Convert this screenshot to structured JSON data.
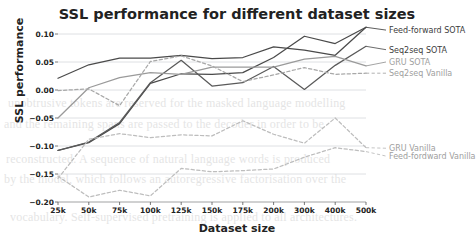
{
  "chart_data": {
    "type": "line",
    "title": "SSL performance for different dataset sizes",
    "xlabel": "Dataset size",
    "ylabel": "SSL performance",
    "categories": [
      "25k",
      "50k",
      "75k",
      "100k",
      "125k",
      "150k",
      "175k",
      "200k",
      "300k",
      "400k",
      "500k"
    ],
    "ylim": [
      -0.2,
      0.1
    ],
    "yticks": [
      "0.10",
      "0.05",
      "0.00",
      "−0.05",
      "−0.10",
      "−0.15",
      "−0.20"
    ],
    "ytick_values": [
      0.1,
      0.05,
      0.0,
      -0.05,
      -0.1,
      -0.15,
      -0.2
    ],
    "grid": "horizontal",
    "legend_position": "line-end-labels",
    "series": [
      {
        "name": "Feed-forward SOTA",
        "style": "solid",
        "color": "#4a4a4a",
        "label_y": 0.107,
        "values": [
          -0.108,
          -0.094,
          -0.06,
          0.012,
          0.029,
          0.028,
          0.031,
          0.058,
          0.096,
          0.083,
          0.112
        ]
      },
      {
        "name": "Seq2seq SOTA",
        "style": "solid",
        "color": "#5a5a5a",
        "label_y": 0.072,
        "values": [
          -0.108,
          -0.093,
          -0.058,
          0.013,
          0.053,
          0.007,
          0.013,
          0.042,
          0.001,
          0.044,
          0.078
        ]
      },
      {
        "name": "GRU SOTA",
        "style": "solid",
        "color": "#9a9a9a",
        "label_y": 0.05,
        "values": [
          -0.05,
          0.004,
          0.022,
          0.031,
          0.028,
          0.041,
          0.041,
          0.041,
          0.055,
          0.06,
          0.043
        ]
      },
      {
        "name": "Seq2seq Vanilla",
        "style": "dashed",
        "color": "#a8a8a8",
        "label_y": 0.03,
        "values": [
          -0.001,
          0.002,
          -0.028,
          0.051,
          0.061,
          0.043,
          0.015,
          0.027,
          0.04,
          0.028,
          0.03
        ]
      },
      {
        "name": "GRU Vanilla",
        "style": "dashed",
        "color": "#bdbdbd",
        "label_y": -0.104,
        "values": [
          -0.158,
          -0.088,
          -0.078,
          -0.085,
          -0.08,
          -0.082,
          -0.055,
          -0.079,
          -0.095,
          -0.05,
          -0.103
        ]
      },
      {
        "name": "Feed-fordward Vanilla",
        "style": "dashed",
        "color": "#bdbdbd",
        "label_y": -0.118,
        "values": [
          -0.154,
          -0.191,
          -0.179,
          -0.189,
          -0.14,
          -0.146,
          -0.144,
          -0.141,
          -0.12,
          -0.103,
          -0.11
        ]
      }
    ],
    "top_solid_overlay": {
      "name": "Feed-forward SOTA upper segment",
      "values": [
        0.021,
        0.045,
        0.057,
        0.057,
        0.062,
        0.056,
        0.058,
        0.077,
        0.071,
        0.062,
        0.112
      ]
    }
  },
  "background_text": {
    "lines": [
      "unobtrusive tokens are reserved for the masked language modelling",
      "and the remaining spans are passed to the decoder in order to be",
      "reconstructed. A sequence of natural language words is produced",
      "by the model, which follows an autoregressive factorisation over the",
      "vocabulary. Self-supervised pretraining is applied to all architectures."
    ]
  }
}
